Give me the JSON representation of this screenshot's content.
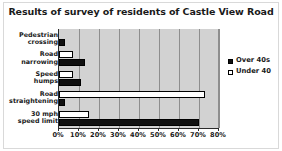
{
  "chart_data": {
    "type": "bar",
    "orientation": "horizontal",
    "title": "Results of survey of residents of Castle View Road",
    "xlabel": "",
    "ylabel": "",
    "categories": [
      "Pedestrian crossing",
      "Road narrowing",
      "Speed humps",
      "Road straightening",
      "30 mph speed limit"
    ],
    "category_lines": [
      [
        "Pedestrian",
        "crossing"
      ],
      [
        "Road",
        "narrowing"
      ],
      [
        "Speed",
        "humps"
      ],
      [
        "Road",
        "straightening"
      ],
      [
        "30 mph",
        "speed limit"
      ]
    ],
    "series": [
      {
        "name": "Over 40s",
        "color": "#101010",
        "style": "filled",
        "values": [
          3,
          13,
          11,
          3,
          70
        ]
      },
      {
        "name": "Under 40",
        "color": "#ffffff",
        "style": "open",
        "values": [
          0,
          7,
          7,
          73,
          15
        ]
      }
    ],
    "xlim": [
      0,
      80
    ],
    "xticks": [
      0,
      10,
      20,
      30,
      40,
      50,
      60,
      70,
      80
    ],
    "xtick_labels": [
      "0%",
      "10%",
      "20%",
      "30%",
      "40%",
      "50%",
      "60%",
      "70%",
      "80%"
    ],
    "grid": true,
    "grid_axis": "x",
    "legend_position": "right",
    "plot_background": "#d2d2d2"
  },
  "legend": {
    "entries": [
      {
        "label": "Over 40s",
        "style": "filled"
      },
      {
        "label": "Under 40",
        "style": "open"
      }
    ]
  }
}
